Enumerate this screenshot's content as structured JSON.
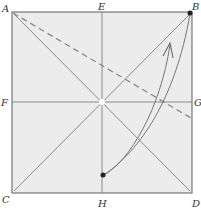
{
  "diagram": {
    "type": "origami-fold-diagram",
    "paper_color": "#ececec",
    "line_color": "#8a8a8a",
    "labels": {
      "A": "A",
      "B": "B",
      "C": "C",
      "D": "D",
      "E": "E",
      "F": "F",
      "G": "G",
      "H": "H"
    },
    "square": {
      "x": 12,
      "y": 12,
      "size": 180
    },
    "crease_lines": [
      "AD diagonal",
      "BC diagonal",
      "EH vertical",
      "FG horizontal"
    ],
    "fold_line": {
      "style": "dashed",
      "from": "A",
      "to": "right edge below G"
    },
    "arrow": {
      "from": "point on EH near H",
      "to": "B",
      "meaning": "fold point to corner B"
    }
  }
}
